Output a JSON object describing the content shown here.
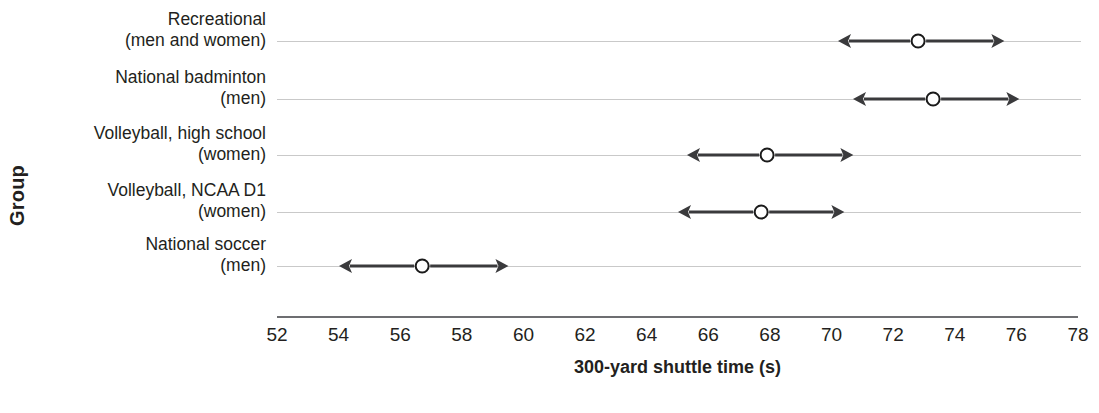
{
  "chart_data": {
    "type": "scatter",
    "title": "",
    "subtitle": "",
    "xlabel": "300-yard shuttle time (s)",
    "ylabel": "Group",
    "xlim": [
      52,
      78
    ],
    "ylim": null,
    "grid": true,
    "grid_axis": "y",
    "legend": false,
    "legend_position": "none",
    "annotations": "Each group is shown as an open-circle mean marker with a double-headed arrow spanning the range (approximately mean +/- 2.7 s).",
    "xticks": [
      52,
      54,
      56,
      58,
      60,
      62,
      64,
      66,
      68,
      70,
      72,
      74,
      76,
      78
    ],
    "xtick_labels": [
      "52",
      "54",
      "56",
      "58",
      "60",
      "62",
      "64",
      "66",
      "68",
      "70",
      "72",
      "74",
      "76",
      "78"
    ],
    "categories": [
      "Recreational (men and women)",
      "National badminton (men)",
      "Volleyball, high school (women)",
      "Volleyball, NCAA D1 (women)",
      "National soccer (men)"
    ],
    "values": [
      72.8,
      73.3,
      67.9,
      67.7,
      56.7
    ],
    "series": [
      {
        "name": "300-yard shuttle time (s)",
        "values": [
          72.8,
          73.3,
          67.9,
          67.7,
          56.7
        ],
        "low": [
          70.2,
          70.7,
          65.3,
          65.0,
          54.0
        ],
        "high": [
          75.6,
          76.1,
          70.7,
          70.4,
          59.5
        ]
      }
    ],
    "points": [
      {
        "category": "Recreational (men and women)",
        "mean": 72.8,
        "low": 70.2,
        "high": 75.6
      },
      {
        "category": "National badminton (men)",
        "mean": 73.3,
        "low": 70.7,
        "high": 76.1
      },
      {
        "category": "Volleyball, high school (women)",
        "mean": 67.9,
        "low": 65.3,
        "high": 70.7
      },
      {
        "category": "Volleyball, NCAA D1 (women)",
        "mean": 67.7,
        "low": 65.0,
        "high": 70.4
      },
      {
        "category": "National soccer (men)",
        "mean": 56.7,
        "low": 54.0,
        "high": 59.5
      }
    ]
  },
  "axes": {
    "y_title": "Group",
    "x_title": "300-yard shuttle time (s)"
  },
  "category_labels": [
    {
      "line1": "Recreational",
      "line2": "(men and women)"
    },
    {
      "line1": "National badminton",
      "line2": "(men)"
    },
    {
      "line1": "Volleyball, high school",
      "line2": "(women)"
    },
    {
      "line1": "Volleyball, NCAA D1",
      "line2": "(women)"
    },
    {
      "line1": "National soccer",
      "line2": "(men)"
    }
  ],
  "ticks": [
    {
      "label": "52"
    },
    {
      "label": "54"
    },
    {
      "label": "56"
    },
    {
      "label": "58"
    },
    {
      "label": "60"
    },
    {
      "label": "62"
    },
    {
      "label": "64"
    },
    {
      "label": "66"
    },
    {
      "label": "68"
    },
    {
      "label": "70"
    },
    {
      "label": "72"
    },
    {
      "label": "74"
    },
    {
      "label": "76"
    },
    {
      "label": "78"
    }
  ],
  "caption": "",
  "colors": {
    "text": "#231f20",
    "gridline": "#c9c9c9",
    "axis": "#6d6e71",
    "marker_stroke": "#3a3a3c",
    "marker_fill": "#ffffff",
    "background": "#ffffff"
  }
}
